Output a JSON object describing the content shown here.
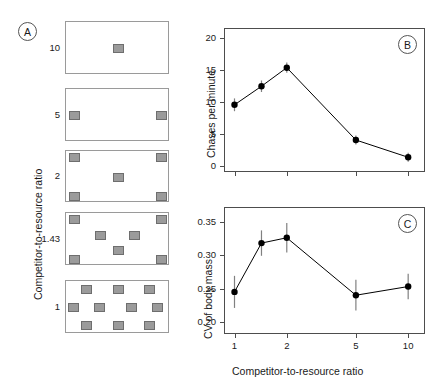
{
  "figure": {
    "width": 442,
    "height": 387,
    "background": "#ffffff",
    "marker_color": "#000000",
    "errorbar_color": "#808080",
    "square_fill": "#9b9b9b",
    "square_stroke": "#6e6e6e",
    "frame_color": "#4d4d4d"
  },
  "panelA": {
    "tag": "A",
    "axis_title": "Competitor-to-resource ratio",
    "rows": [
      {
        "label": "10",
        "n_squares": 1
      },
      {
        "label": "5",
        "n_squares": 2
      },
      {
        "label": "2",
        "n_squares": 5
      },
      {
        "label": "1.43",
        "n_squares": 7
      },
      {
        "label": "1",
        "n_squares": 10
      }
    ]
  },
  "chart_data": [
    {
      "panel": "B",
      "tag": "B",
      "type": "line",
      "title": "",
      "xlabel": "",
      "ylabel": "Chases per minute",
      "x": [
        1,
        1.43,
        2,
        5,
        10
      ],
      "x_tick_labels": [
        "1",
        "1.43",
        "2",
        "5",
        "10"
      ],
      "x_scale": "log",
      "xlim": [
        0.87,
        12.5
      ],
      "values": [
        9.5,
        12.4,
        15.3,
        4.0,
        1.3
      ],
      "errors": [
        1.0,
        0.9,
        0.8,
        0.7,
        0.7
      ],
      "y_ticks": [
        0,
        5,
        10,
        15,
        20
      ],
      "y_tick_labels": [
        "0",
        "5",
        "10",
        "15",
        "20"
      ],
      "ylim": [
        -1.0,
        21.5
      ],
      "grid": false,
      "legend": "none",
      "marker": "filled-circle",
      "errorbar": true
    },
    {
      "panel": "C",
      "tag": "C",
      "type": "line",
      "title": "",
      "xlabel": "Competitor-to-resource ratio",
      "ylabel": "CV of body mass",
      "x": [
        1,
        1.43,
        2,
        5,
        10
      ],
      "x_tick_labels": [
        "1",
        "1.43",
        "2",
        "5",
        "10"
      ],
      "x_scale": "log",
      "xlim": [
        0.87,
        12.5
      ],
      "values": [
        0.245,
        0.318,
        0.326,
        0.24,
        0.253
      ],
      "errors": [
        0.024,
        0.019,
        0.022,
        0.023,
        0.019
      ],
      "y_ticks": [
        0.2,
        0.25,
        0.3,
        0.35
      ],
      "y_tick_labels": [
        "0.20",
        "0.25",
        "0.30",
        "0.35"
      ],
      "ylim": [
        0.182,
        0.372
      ],
      "grid": false,
      "legend": "none",
      "marker": "filled-circle",
      "errorbar": true
    }
  ]
}
